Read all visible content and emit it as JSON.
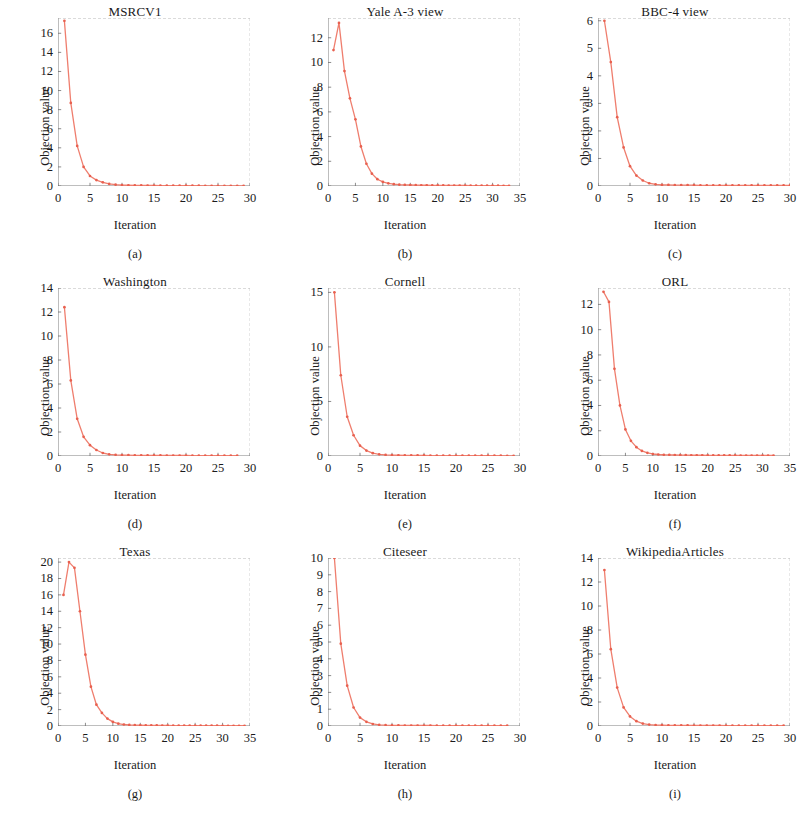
{
  "figure": {
    "rows": 3,
    "cols": 3,
    "series_color": "#ef7e6e",
    "marker_color": "#e8604f",
    "axis_color": "#6e6e6e",
    "background": "#ffffff",
    "common_xlabel": "Iteration",
    "common_ylabel": "Objection value"
  },
  "chart_data": [
    {
      "type": "line",
      "panel": "a",
      "caption": "(a)",
      "title": "MSRCV1",
      "xlabel": "Iteration",
      "ylabel": "Objection value",
      "xlim": [
        0,
        30
      ],
      "ylim": [
        0,
        17.6
      ],
      "xticks": [
        0,
        5,
        10,
        15,
        20,
        25,
        30
      ],
      "yticks": [
        0,
        2,
        4,
        6,
        8,
        10,
        12,
        14,
        16
      ],
      "grid": false,
      "legend": "none",
      "x": [
        1,
        2,
        3,
        4,
        5,
        6,
        7,
        8,
        9,
        10,
        11,
        12,
        13,
        14,
        15,
        16,
        17,
        18,
        19,
        20,
        21,
        22,
        23,
        24,
        25,
        26,
        27,
        28,
        29
      ],
      "values": [
        17.3,
        8.7,
        4.2,
        2.0,
        1.05,
        0.62,
        0.38,
        0.22,
        0.14,
        0.1,
        0.08,
        0.07,
        0.06,
        0.05,
        0.05,
        0.04,
        0.04,
        0.04,
        0.03,
        0.03,
        0.03,
        0.03,
        0.02,
        0.02,
        0.02,
        0.02,
        0.02,
        0.02,
        0.02
      ]
    },
    {
      "type": "line",
      "panel": "b",
      "caption": "(b)",
      "title": "Yale A-3 view",
      "xlabel": "Iteration",
      "ylabel": "Objection value",
      "xlim": [
        0,
        35
      ],
      "ylim": [
        0,
        13.6
      ],
      "xticks": [
        0,
        5,
        10,
        15,
        20,
        25,
        30,
        35
      ],
      "yticks": [
        0,
        2,
        4,
        6,
        8,
        10,
        12
      ],
      "grid": false,
      "legend": "none",
      "x": [
        1,
        2,
        3,
        4,
        5,
        6,
        7,
        8,
        9,
        10,
        11,
        12,
        13,
        14,
        15,
        16,
        17,
        18,
        19,
        20,
        21,
        22,
        23,
        24,
        25,
        26,
        27,
        28,
        29,
        30,
        31,
        32,
        33
      ],
      "values": [
        11.0,
        13.2,
        9.3,
        7.1,
        5.4,
        3.2,
        1.8,
        1.0,
        0.55,
        0.33,
        0.22,
        0.15,
        0.11,
        0.09,
        0.08,
        0.07,
        0.06,
        0.06,
        0.05,
        0.05,
        0.05,
        0.04,
        0.04,
        0.04,
        0.04,
        0.03,
        0.03,
        0.03,
        0.03,
        0.03,
        0.03,
        0.02,
        0.02
      ]
    },
    {
      "type": "line",
      "panel": "c",
      "caption": "(c)",
      "title": "BBC-4 view",
      "xlabel": "Iteration",
      "ylabel": "Objection value",
      "xlim": [
        0,
        30
      ],
      "ylim": [
        0,
        6.1
      ],
      "xticks": [
        0,
        5,
        10,
        15,
        20,
        25,
        30
      ],
      "yticks": [
        0,
        1,
        2,
        3,
        4,
        5,
        6
      ],
      "grid": false,
      "legend": "none",
      "x": [
        1,
        2,
        3,
        4,
        5,
        6,
        7,
        8,
        9,
        10,
        11,
        12,
        13,
        14,
        15,
        16,
        17,
        18,
        19,
        20,
        21,
        22,
        23,
        24,
        25,
        26,
        27,
        28,
        29,
        30
      ],
      "values": [
        6.0,
        4.5,
        2.5,
        1.4,
        0.72,
        0.38,
        0.2,
        0.1,
        0.06,
        0.04,
        0.04,
        0.03,
        0.03,
        0.03,
        0.03,
        0.02,
        0.02,
        0.02,
        0.02,
        0.02,
        0.02,
        0.02,
        0.02,
        0.02,
        0.02,
        0.02,
        0.02,
        0.02,
        0.02,
        0.02
      ]
    },
    {
      "type": "line",
      "panel": "d",
      "caption": "(d)",
      "title": "Washington",
      "xlabel": "Iteration",
      "ylabel": "Objection value",
      "xlim": [
        0,
        30
      ],
      "ylim": [
        0,
        14
      ],
      "xticks": [
        0,
        5,
        10,
        15,
        20,
        25,
        30
      ],
      "yticks": [
        0,
        2,
        4,
        6,
        8,
        10,
        12,
        14
      ],
      "grid": false,
      "legend": "none",
      "x": [
        1,
        2,
        3,
        4,
        5,
        6,
        7,
        8,
        9,
        10,
        11,
        12,
        13,
        14,
        15,
        16,
        17,
        18,
        19,
        20,
        21,
        22,
        23,
        24,
        25,
        26,
        27,
        28
      ],
      "values": [
        12.4,
        6.3,
        3.1,
        1.6,
        0.9,
        0.5,
        0.25,
        0.14,
        0.1,
        0.08,
        0.07,
        0.06,
        0.06,
        0.05,
        0.05,
        0.05,
        0.04,
        0.04,
        0.04,
        0.04,
        0.03,
        0.03,
        0.03,
        0.03,
        0.03,
        0.03,
        0.03,
        0.03
      ]
    },
    {
      "type": "line",
      "panel": "e",
      "caption": "(e)",
      "title": "Cornell",
      "xlabel": "Iteration",
      "ylabel": "Objection value",
      "xlim": [
        0,
        30
      ],
      "ylim": [
        0,
        15.4
      ],
      "xticks": [
        0,
        5,
        10,
        15,
        20,
        25,
        30
      ],
      "yticks": [
        0,
        5,
        10,
        15
      ],
      "grid": false,
      "legend": "none",
      "x": [
        1,
        2,
        3,
        4,
        5,
        6,
        7,
        8,
        9,
        10,
        11,
        12,
        13,
        14,
        15,
        16,
        17,
        18,
        19,
        20,
        21,
        22,
        23,
        24,
        25,
        26,
        27,
        28,
        29
      ],
      "values": [
        15.0,
        7.4,
        3.6,
        1.9,
        0.95,
        0.5,
        0.26,
        0.15,
        0.1,
        0.08,
        0.07,
        0.06,
        0.05,
        0.05,
        0.05,
        0.04,
        0.04,
        0.04,
        0.04,
        0.03,
        0.03,
        0.03,
        0.03,
        0.03,
        0.03,
        0.03,
        0.03,
        0.02,
        0.02
      ]
    },
    {
      "type": "line",
      "panel": "f",
      "caption": "(f)",
      "title": "ORL",
      "xlabel": "Iteration",
      "ylabel": "Objection value",
      "xlim": [
        0,
        35
      ],
      "ylim": [
        0,
        13.3
      ],
      "xticks": [
        0,
        5,
        10,
        15,
        20,
        25,
        30,
        35
      ],
      "yticks": [
        0,
        2,
        4,
        6,
        8,
        10,
        12
      ],
      "grid": false,
      "legend": "none",
      "x": [
        1,
        2,
        3,
        4,
        5,
        6,
        7,
        8,
        9,
        10,
        11,
        12,
        13,
        14,
        15,
        16,
        17,
        18,
        19,
        20,
        21,
        22,
        23,
        24,
        25,
        26,
        27,
        28,
        29,
        30,
        31,
        32
      ],
      "values": [
        13.0,
        12.2,
        6.9,
        4.0,
        2.1,
        1.2,
        0.7,
        0.4,
        0.25,
        0.16,
        0.12,
        0.1,
        0.09,
        0.08,
        0.07,
        0.07,
        0.06,
        0.06,
        0.06,
        0.05,
        0.05,
        0.05,
        0.05,
        0.05,
        0.05,
        0.04,
        0.04,
        0.04,
        0.04,
        0.04,
        0.04,
        0.04
      ]
    },
    {
      "type": "line",
      "panel": "g",
      "caption": "(g)",
      "title": "Texas",
      "xlabel": "Iteration",
      "ylabel": "Objection value",
      "xlim": [
        0,
        35
      ],
      "ylim": [
        0,
        20.5
      ],
      "xticks": [
        0,
        5,
        10,
        15,
        20,
        25,
        30,
        35
      ],
      "yticks": [
        0,
        2,
        4,
        6,
        8,
        10,
        12,
        14,
        16,
        18,
        20
      ],
      "grid": false,
      "legend": "none",
      "x": [
        1,
        2,
        3,
        4,
        5,
        6,
        7,
        8,
        9,
        10,
        11,
        12,
        13,
        14,
        15,
        16,
        17,
        18,
        19,
        20,
        21,
        22,
        23,
        24,
        25,
        26,
        27,
        28,
        29,
        30,
        31,
        32,
        33,
        34
      ],
      "values": [
        16.0,
        20.0,
        19.3,
        14.0,
        8.7,
        4.8,
        2.6,
        1.6,
        0.9,
        0.5,
        0.28,
        0.18,
        0.13,
        0.1,
        0.09,
        0.08,
        0.07,
        0.07,
        0.06,
        0.06,
        0.05,
        0.05,
        0.05,
        0.05,
        0.04,
        0.04,
        0.04,
        0.04,
        0.04,
        0.03,
        0.03,
        0.03,
        0.03,
        0.03
      ]
    },
    {
      "type": "line",
      "panel": "h",
      "caption": "(h)",
      "title": "Citeseer",
      "xlabel": "Iteration",
      "ylabel": "Objection value",
      "xlim": [
        0,
        30
      ],
      "ylim": [
        0,
        10
      ],
      "xticks": [
        0,
        5,
        10,
        15,
        20,
        25,
        30
      ],
      "yticks": [
        0,
        1,
        2,
        3,
        4,
        5,
        6,
        7,
        8,
        9,
        10
      ],
      "grid": false,
      "legend": "none",
      "x": [
        1,
        2,
        3,
        4,
        5,
        6,
        7,
        8,
        9,
        10,
        11,
        12,
        13,
        14,
        15,
        16,
        17,
        18,
        19,
        20,
        21,
        22,
        23,
        24,
        25,
        26,
        27,
        28
      ],
      "values": [
        10.0,
        4.9,
        2.4,
        1.1,
        0.5,
        0.25,
        0.12,
        0.07,
        0.05,
        0.04,
        0.04,
        0.03,
        0.03,
        0.03,
        0.03,
        0.03,
        0.02,
        0.02,
        0.02,
        0.02,
        0.02,
        0.02,
        0.02,
        0.02,
        0.02,
        0.02,
        0.02,
        0.02
      ]
    },
    {
      "type": "line",
      "panel": "i",
      "caption": "(i)",
      "title": "WikipediaArticles",
      "xlabel": "Iteration",
      "ylabel": "Objection value",
      "xlim": [
        0,
        30
      ],
      "ylim": [
        0,
        14
      ],
      "xticks": [
        0,
        5,
        10,
        15,
        20,
        25,
        30
      ],
      "yticks": [
        0,
        2,
        4,
        6,
        8,
        10,
        12,
        14
      ],
      "grid": false,
      "legend": "none",
      "x": [
        1,
        2,
        3,
        4,
        5,
        6,
        7,
        8,
        9,
        10,
        11,
        12,
        13,
        14,
        15,
        16,
        17,
        18,
        19,
        20,
        21,
        22,
        23,
        24,
        25,
        26,
        27,
        28,
        29
      ],
      "values": [
        13.0,
        6.4,
        3.2,
        1.55,
        0.8,
        0.4,
        0.2,
        0.12,
        0.08,
        0.07,
        0.06,
        0.05,
        0.05,
        0.05,
        0.04,
        0.04,
        0.04,
        0.04,
        0.04,
        0.03,
        0.03,
        0.03,
        0.03,
        0.03,
        0.03,
        0.03,
        0.03,
        0.03,
        0.03
      ]
    }
  ]
}
